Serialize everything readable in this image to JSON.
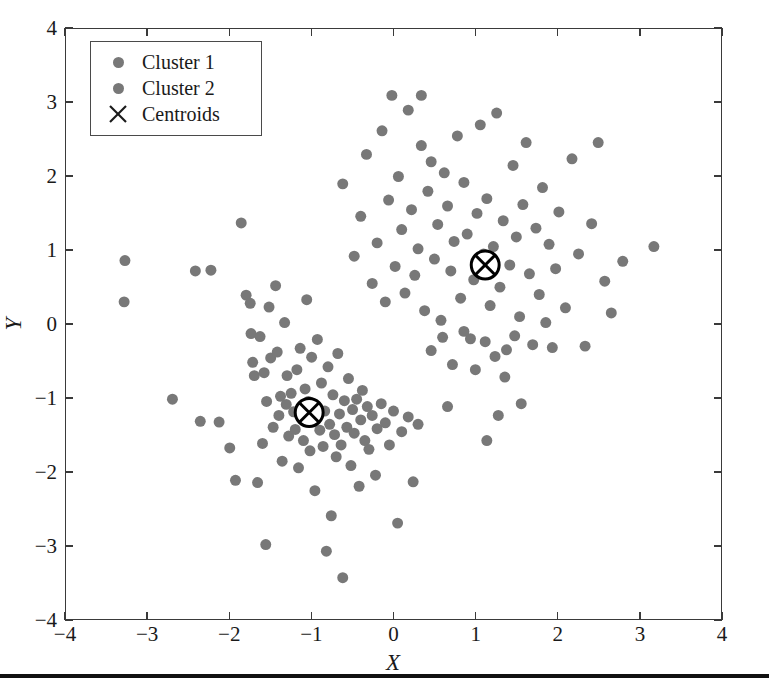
{
  "figure": {
    "background": "#ffffff",
    "point_color": "#787878",
    "axis_color": "#3a3a3a",
    "centroid_color": "#000000"
  },
  "axes": {
    "xlabel": "X",
    "ylabel": "Y",
    "xlim": [
      -4,
      4
    ],
    "ylim": [
      -4,
      4
    ],
    "xticks": [
      "-4",
      "-3",
      "-2",
      "-1",
      "0",
      "1",
      "2",
      "3",
      "4"
    ],
    "yticks": [
      "4",
      "3",
      "2",
      "1",
      "0",
      "-1",
      "-2",
      "-3",
      "-4"
    ],
    "xtick_values": [
      -4,
      -3,
      -2,
      -1,
      0,
      1,
      2,
      3,
      4
    ],
    "ytick_values": [
      4,
      3,
      2,
      1,
      0,
      -1,
      -2,
      -3,
      -4
    ],
    "grid": false
  },
  "legend": {
    "position": "upper-left",
    "items": [
      {
        "label": "Cluster 1",
        "marker": "dot-icon",
        "color": "#787878"
      },
      {
        "label": "Cluster 2",
        "marker": "dot-icon",
        "color": "#787878"
      },
      {
        "label": "Centroids",
        "marker": "x-cross-icon",
        "color": "#1a1a1a"
      }
    ]
  },
  "chart_data": {
    "type": "scatter",
    "title": "",
    "xlabel": "X",
    "ylabel": "Y",
    "xlim": [
      -4,
      4
    ],
    "ylim": [
      -4,
      4
    ],
    "grid": false,
    "legend_position": "upper-left",
    "marker_color": "#787878",
    "marker_size": 11,
    "series": [
      {
        "name": "Cluster 1",
        "color": "#787878",
        "points": [
          [
            -3.28,
            0.86
          ],
          [
            -3.29,
            0.3
          ],
          [
            -2.7,
            -1.02
          ],
          [
            -2.42,
            0.72
          ],
          [
            -2.36,
            -1.32
          ],
          [
            -2.23,
            0.73
          ],
          [
            -2.13,
            -1.33
          ],
          [
            -2.0,
            -1.68
          ],
          [
            -1.93,
            -2.12
          ],
          [
            -1.86,
            1.37
          ],
          [
            -1.8,
            0.39
          ],
          [
            -1.75,
            0.28
          ],
          [
            -1.74,
            -0.13
          ],
          [
            -1.72,
            -0.52
          ],
          [
            -1.7,
            -0.7
          ],
          [
            -1.66,
            -2.15
          ],
          [
            -1.63,
            -0.17
          ],
          [
            -1.6,
            -1.62
          ],
          [
            -1.58,
            -0.66
          ],
          [
            -1.56,
            -2.99
          ],
          [
            -1.55,
            -1.05
          ],
          [
            -1.52,
            0.23
          ],
          [
            -1.5,
            -0.46
          ],
          [
            -1.47,
            -1.4
          ],
          [
            -1.44,
            0.52
          ],
          [
            -1.42,
            -0.38
          ],
          [
            -1.4,
            -1.24
          ],
          [
            -1.38,
            -0.98
          ],
          [
            -1.36,
            -1.86
          ],
          [
            -1.33,
            0.02
          ],
          [
            -1.31,
            -1.09
          ],
          [
            -1.3,
            -0.7
          ],
          [
            -1.28,
            -1.52
          ],
          [
            -1.25,
            -0.94
          ],
          [
            -1.22,
            -1.19
          ],
          [
            -1.2,
            -1.43
          ],
          [
            -1.18,
            -0.62
          ],
          [
            -1.16,
            -1.95
          ],
          [
            -1.14,
            -0.33
          ],
          [
            -1.12,
            -1.27
          ],
          [
            -1.1,
            -1.58
          ],
          [
            -1.08,
            -0.88
          ],
          [
            -1.06,
            0.33
          ],
          [
            -1.04,
            -1.05
          ],
          [
            -1.02,
            -1.72
          ],
          [
            -1.0,
            -0.45
          ],
          [
            -0.98,
            -1.3
          ],
          [
            -0.96,
            -2.26
          ],
          [
            -0.95,
            -1.12
          ],
          [
            -0.93,
            -0.21
          ],
          [
            -0.9,
            -1.44
          ],
          [
            -0.88,
            -0.8
          ],
          [
            -0.86,
            -1.66
          ],
          [
            -0.84,
            -1.18
          ],
          [
            -0.82,
            -3.08
          ],
          [
            -0.8,
            -0.58
          ],
          [
            -0.78,
            -1.36
          ],
          [
            -0.76,
            -2.6
          ],
          [
            -0.74,
            -0.96
          ],
          [
            -0.72,
            -1.5
          ],
          [
            -0.7,
            -1.8
          ],
          [
            -0.68,
            -0.4
          ],
          [
            -0.66,
            -1.22
          ],
          [
            -0.64,
            -1.64
          ],
          [
            -0.62,
            -3.44
          ],
          [
            -0.6,
            -1.04
          ],
          [
            -0.57,
            -1.4
          ],
          [
            -0.55,
            -0.74
          ],
          [
            -0.52,
            -1.92
          ],
          [
            -0.5,
            -1.16
          ],
          [
            -0.48,
            -1.48
          ],
          [
            -0.45,
            -1.02
          ],
          [
            -0.42,
            -2.2
          ],
          [
            -0.4,
            -1.3
          ],
          [
            -0.38,
            -0.9
          ],
          [
            -0.35,
            -1.58
          ],
          [
            -0.32,
            -1.12
          ],
          [
            -0.3,
            -1.7
          ],
          [
            -0.26,
            -1.24
          ],
          [
            -0.22,
            -2.05
          ],
          [
            -0.2,
            -1.42
          ],
          [
            -0.15,
            -1.08
          ],
          [
            -0.1,
            -1.34
          ],
          [
            -0.05,
            -1.64
          ],
          [
            0.0,
            -1.18
          ],
          [
            0.05,
            -2.7
          ],
          [
            0.1,
            -1.46
          ],
          [
            0.18,
            -1.26
          ],
          [
            0.24,
            -2.14
          ],
          [
            0.3,
            -1.36
          ]
        ]
      },
      {
        "name": "Cluster 2",
        "color": "#787878",
        "points": [
          [
            -0.62,
            1.9
          ],
          [
            -0.48,
            0.92
          ],
          [
            -0.4,
            1.46
          ],
          [
            -0.33,
            2.3
          ],
          [
            -0.26,
            0.55
          ],
          [
            -0.2,
            1.1
          ],
          [
            -0.14,
            2.62
          ],
          [
            -0.1,
            0.3
          ],
          [
            -0.06,
            1.68
          ],
          [
            -0.02,
            3.1
          ],
          [
            0.02,
            0.78
          ],
          [
            0.06,
            2.0
          ],
          [
            0.1,
            1.28
          ],
          [
            0.14,
            0.42
          ],
          [
            0.18,
            2.9
          ],
          [
            0.22,
            1.55
          ],
          [
            0.26,
            0.66
          ],
          [
            0.3,
            1.02
          ],
          [
            0.34,
            2.42
          ],
          [
            0.38,
            0.18
          ],
          [
            0.42,
            1.8
          ],
          [
            0.46,
            2.2
          ],
          [
            0.5,
            0.88
          ],
          [
            0.54,
            1.35
          ],
          [
            0.58,
            0.05
          ],
          [
            0.62,
            2.05
          ],
          [
            0.66,
            1.6
          ],
          [
            0.7,
            0.72
          ],
          [
            0.74,
            1.12
          ],
          [
            0.78,
            2.55
          ],
          [
            0.82,
            0.35
          ],
          [
            0.86,
            1.92
          ],
          [
            0.9,
            1.22
          ],
          [
            0.94,
            -0.2
          ],
          [
            0.98,
            0.6
          ],
          [
            1.02,
            1.5
          ],
          [
            1.06,
            2.7
          ],
          [
            1.1,
            0.95
          ],
          [
            1.14,
            1.7
          ],
          [
            1.18,
            0.25
          ],
          [
            1.22,
            1.05
          ],
          [
            1.26,
            2.86
          ],
          [
            1.3,
            0.5
          ],
          [
            1.34,
            1.4
          ],
          [
            1.38,
            -0.35
          ],
          [
            1.42,
            0.8
          ],
          [
            1.46,
            2.15
          ],
          [
            1.5,
            1.18
          ],
          [
            1.54,
            0.1
          ],
          [
            1.58,
            1.62
          ],
          [
            1.62,
            2.46
          ],
          [
            1.66,
            0.68
          ],
          [
            1.7,
            -0.28
          ],
          [
            1.74,
            1.3
          ],
          [
            1.78,
            0.4
          ],
          [
            1.82,
            1.85
          ],
          [
            1.86,
            0.02
          ],
          [
            1.9,
            1.08
          ],
          [
            1.94,
            -0.32
          ],
          [
            1.98,
            0.75
          ],
          [
            2.02,
            1.52
          ],
          [
            2.1,
            0.22
          ],
          [
            2.18,
            2.24
          ],
          [
            2.26,
            0.95
          ],
          [
            2.34,
            -0.3
          ],
          [
            2.42,
            1.36
          ],
          [
            2.5,
            2.46
          ],
          [
            2.58,
            0.58
          ],
          [
            2.66,
            0.15
          ],
          [
            2.8,
            0.85
          ],
          [
            3.18,
            1.05
          ],
          [
            0.46,
            -0.36
          ],
          [
            0.6,
            -0.18
          ],
          [
            0.72,
            -0.55
          ],
          [
            0.86,
            -0.1
          ],
          [
            1.0,
            -0.62
          ],
          [
            1.12,
            -0.24
          ],
          [
            1.24,
            -0.44
          ],
          [
            1.36,
            -0.72
          ],
          [
            1.48,
            -0.16
          ],
          [
            1.56,
            -1.08
          ],
          [
            1.14,
            -1.58
          ],
          [
            0.66,
            -1.12
          ],
          [
            1.28,
            -1.24
          ],
          [
            0.34,
            3.1
          ]
        ]
      }
    ],
    "centroids": {
      "name": "Centroids",
      "marker": "x-cross-icon",
      "color": "#000000",
      "points": [
        [
          -1.03,
          -1.2
        ],
        [
          1.12,
          0.8
        ]
      ]
    }
  },
  "bottom_rule": {
    "color": "#111111"
  }
}
